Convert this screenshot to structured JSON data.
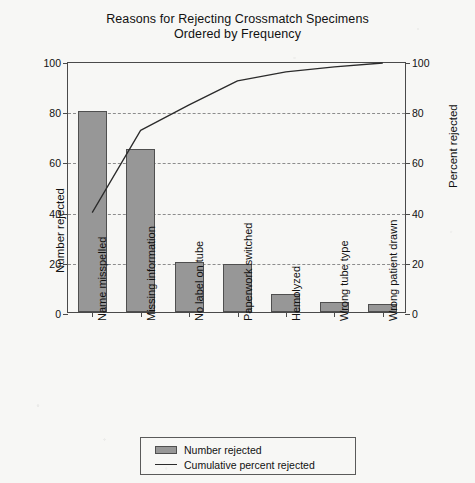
{
  "chart_data": {
    "type": "bar",
    "title": "Reasons for Rejecting Crossmatch Specimens",
    "subtitle": "Ordered by Frequency",
    "categories": [
      "Name misspelled",
      "Missing information",
      "No label on tube",
      "Paperwork switched",
      "Hemolyzed",
      "Wrong tube type",
      "Wrong patient drawn"
    ],
    "series": [
      {
        "name": "Number rejected",
        "type": "bar",
        "axis": "left",
        "values": [
          80,
          65,
          20,
          19,
          7,
          4,
          3
        ]
      },
      {
        "name": "Cumulative percent rejected",
        "type": "line",
        "axis": "right",
        "values": [
          40.4,
          73.2,
          83.3,
          92.9,
          96.5,
          98.5,
          100.0
        ]
      }
    ],
    "xlabel": "",
    "ylabel": "Number rejected",
    "y2label": "Percent rejected",
    "ylim": [
      0,
      100
    ],
    "y2lim": [
      0,
      100
    ],
    "yticks": [
      0,
      20,
      40,
      60,
      80,
      100
    ],
    "y2ticks": [
      0,
      20,
      40,
      60,
      80,
      100
    ],
    "grid": true,
    "grid_style": "dashed-horizontal",
    "legend_position": "bottom-center",
    "colors": {
      "bar_fill": "#979797",
      "bar_edge": "#4f4f4f",
      "line": "#2b2b2b",
      "grid": "#8d8d8d",
      "axis": "#4a4a4a",
      "background": "#f7f7f5",
      "text": "#111111"
    }
  },
  "legend": {
    "items": [
      {
        "label": "Number rejected",
        "marker": "filled-gray-box"
      },
      {
        "label": "Cumulative percent rejected",
        "marker": "solid-line"
      }
    ]
  }
}
